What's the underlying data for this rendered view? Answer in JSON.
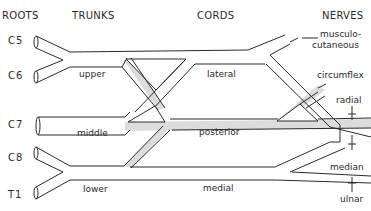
{
  "headers": {
    "roots": "ROOTS",
    "trunks": "TRUNKS",
    "cords": "CORDS",
    "nerves": "NERVES"
  },
  "roots": [
    "C5",
    "C6",
    "C7",
    "C8",
    "T1"
  ],
  "trunks": {
    "upper": "upper",
    "middle": "middle",
    "lower": "lower"
  },
  "cords": {
    "lateral": "lateral",
    "posterior": "posterior",
    "medial": "medial"
  },
  "nerves": {
    "musculo_line1": "musculo-",
    "musculo_line2": "cutaneous",
    "circumflex": "circumflex",
    "radial": "radial",
    "median": "median",
    "ulnar": "ulnar"
  },
  "colors": {
    "line": "#2a2a2a",
    "posterior_fill": "#dcdcdc",
    "background": "#ffffff"
  }
}
